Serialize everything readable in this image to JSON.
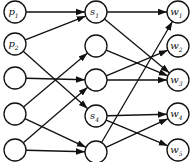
{
  "columns": [
    {
      "name": "left",
      "nodes": [
        {
          "id": "p1",
          "label": "p",
          "sub": "1"
        },
        {
          "id": "p2",
          "label": "p",
          "sub": "2"
        },
        {
          "id": "l3",
          "label": "",
          "sub": ""
        },
        {
          "id": "l4",
          "label": "",
          "sub": ""
        },
        {
          "id": "l5",
          "label": "",
          "sub": ""
        }
      ]
    },
    {
      "name": "middle",
      "nodes": [
        {
          "id": "s1",
          "label": "s",
          "sub": "1"
        },
        {
          "id": "m2",
          "label": "",
          "sub": ""
        },
        {
          "id": "m3",
          "label": "",
          "sub": ""
        },
        {
          "id": "s4",
          "label": "s",
          "sub": "4"
        },
        {
          "id": "m5",
          "label": "",
          "sub": ""
        }
      ]
    },
    {
      "name": "right",
      "nodes": [
        {
          "id": "w1",
          "label": "w",
          "sub": "1"
        },
        {
          "id": "w2",
          "label": "w",
          "sub": "2"
        },
        {
          "id": "w3",
          "label": "w",
          "sub": "3"
        },
        {
          "id": "w4",
          "label": "w",
          "sub": "4"
        },
        {
          "id": "w5",
          "label": "w",
          "sub": "5"
        }
      ]
    }
  ],
  "edges": [
    {
      "from": "p1",
      "to": "s1"
    },
    {
      "from": "p2",
      "to": "s1"
    },
    {
      "from": "p2",
      "to": "s4"
    },
    {
      "from": "l3",
      "to": "m3"
    },
    {
      "from": "l4",
      "to": "m2"
    },
    {
      "from": "l4",
      "to": "m5"
    },
    {
      "from": "l5",
      "to": "m3"
    },
    {
      "from": "l5",
      "to": "m5"
    },
    {
      "from": "s1",
      "to": "w1"
    },
    {
      "from": "s1",
      "to": "w3"
    },
    {
      "from": "m2",
      "to": "w3"
    },
    {
      "from": "m3",
      "to": "w2"
    },
    {
      "from": "m3",
      "to": "w3"
    },
    {
      "from": "s4",
      "to": "w4"
    },
    {
      "from": "s4",
      "to": "w5"
    },
    {
      "from": "m5",
      "to": "w1"
    },
    {
      "from": "m5",
      "to": "w4"
    }
  ]
}
